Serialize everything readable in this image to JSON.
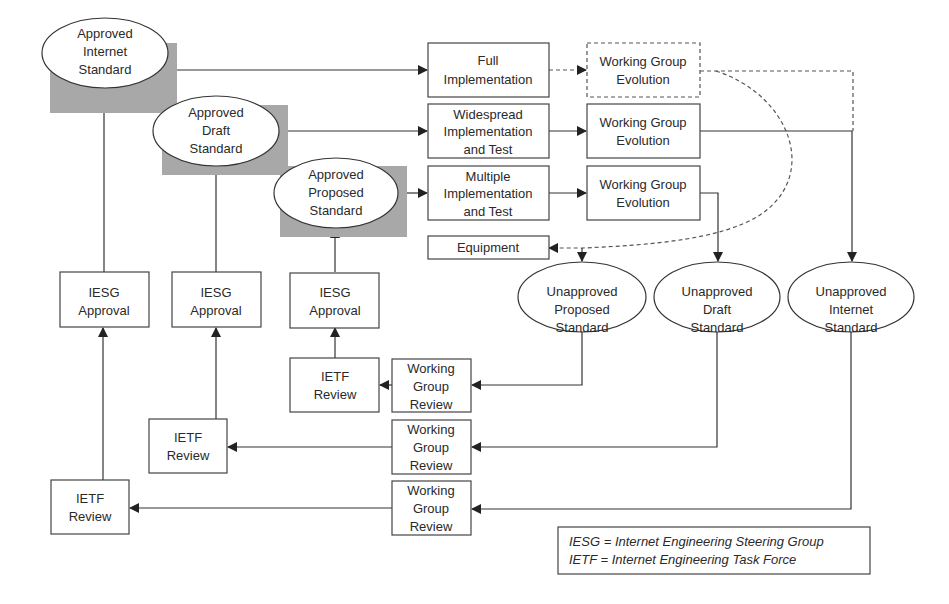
{
  "diagram": {
    "type": "flowchart",
    "approved": {
      "internet": [
        "Approved",
        "Internet",
        "Standard"
      ],
      "draft": [
        "Approved",
        "Draft",
        "Standard"
      ],
      "proposed": [
        "Approved",
        "Proposed",
        "Standard"
      ]
    },
    "implementation": {
      "full": [
        "Full",
        "Implementation"
      ],
      "widespread": [
        "Widespread",
        "Implementation",
        "and Test"
      ],
      "multiple": [
        "Multiple",
        "Implementation",
        "and Test"
      ],
      "equipment": "Equipment"
    },
    "evolution": {
      "internet": [
        "Working Group",
        "Evolution"
      ],
      "draft": [
        "Working Group",
        "Evolution"
      ],
      "proposed": [
        "Working Group",
        "Evolution"
      ]
    },
    "unapproved": {
      "proposed": [
        "Unapproved",
        "Proposed",
        "Standard"
      ],
      "draft": [
        "Unapproved",
        "Draft",
        "Standard"
      ],
      "internet": [
        "Unapproved",
        "Internet",
        "Standard"
      ]
    },
    "iesg": {
      "internet": [
        "IESG",
        "Approval"
      ],
      "draft": [
        "IESG",
        "Approval"
      ],
      "proposed": [
        "IESG",
        "Approval"
      ]
    },
    "ietf": {
      "proposed": [
        "IETF",
        "Review"
      ],
      "draft": [
        "IETF",
        "Review"
      ],
      "internet": [
        "IETF",
        "Review"
      ]
    },
    "wg_review": {
      "proposed": [
        "Working",
        "Group",
        "Review"
      ],
      "draft": [
        "Working",
        "Group",
        "Review"
      ],
      "internet": [
        "Working",
        "Group",
        "Review"
      ]
    },
    "legend": {
      "line1": "IESG = Internet Engineering Steering Group",
      "line2": "IETF = Internet Engineering Task Force"
    },
    "colors": {
      "shade": "#a8a8a8",
      "stroke": "#333333",
      "background": "#ffffff"
    }
  }
}
